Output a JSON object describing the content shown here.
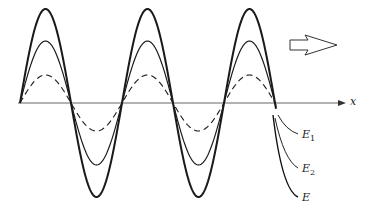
{
  "diagram": {
    "axis": {
      "label": "x"
    },
    "curves": [
      {
        "id": "E1",
        "label": "E",
        "subscript": "1",
        "style": "dashed",
        "amplitude": 28
      },
      {
        "id": "E2",
        "label": "E",
        "subscript": "2",
        "style": "solid-thin",
        "amplitude": 62
      },
      {
        "id": "E",
        "label": "E",
        "subscript": "",
        "style": "solid-thick",
        "amplitude": 94
      }
    ],
    "propagation_arrow": {
      "direction": "right",
      "icon": "hollow-arrow-icon"
    },
    "colors": {
      "line": "#1a1a1a",
      "axis": "#555555",
      "background": "#ffffff"
    }
  }
}
